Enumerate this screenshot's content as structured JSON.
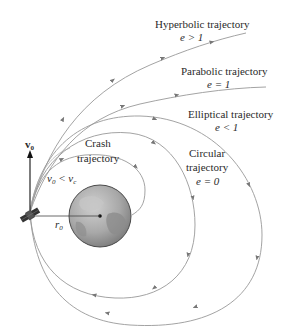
{
  "diagram": {
    "trajectories": [
      {
        "name": "Hyperbolic trajectory",
        "condition": "e > 1"
      },
      {
        "name": "Parabolic trajectory",
        "condition": "e = 1"
      },
      {
        "name": "Elliptical trajectory",
        "condition": "e < 1"
      },
      {
        "name": "Circular trajectory",
        "condition": "e = 0"
      },
      {
        "name": "Crash trajectory",
        "condition": "v0 < vc"
      }
    ],
    "labels": {
      "hyperbolic_title": "Hyperbolic trajectory",
      "hyperbolic_condition": "e > 1",
      "parabolic_title": "Parabolic trajectory",
      "parabolic_condition": "e = 1",
      "elliptical_title": "Elliptical trajectory",
      "elliptical_condition": "e < 1",
      "circular_line1": "Circular",
      "circular_line2": "trajectory",
      "circular_condition": "e = 0",
      "crash_line1": "Crash",
      "crash_line2": "trajectory",
      "crash_condition_v": "v",
      "crash_condition_sub0": "0",
      "crash_condition_lt": " < ",
      "crash_condition_vc": "v",
      "crash_condition_subc": "c",
      "velocity_symbol": "v",
      "velocity_sub": "0",
      "radius_symbol": "r",
      "radius_sub": "0"
    },
    "colors": {
      "curve": "#8a8a8a",
      "earth_fill": "#9a9a9a",
      "earth_outline": "#4a4a4a",
      "text": "#2a2a2a"
    }
  }
}
